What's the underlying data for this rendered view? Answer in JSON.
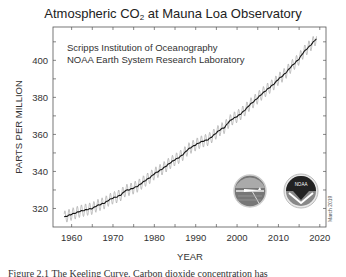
{
  "chart_data": {
    "type": "line",
    "title": "Atmospheric CO2 at Mauna Loa Observatory",
    "title_parts": {
      "pre": "Atmospheric CO",
      "sub": "2",
      "post": " at Mauna Loa Observatory"
    },
    "annotations": [
      "Scripps Institution of Oceanography",
      "NOAA Earth System Research Laboratory",
      "March 2019"
    ],
    "xlabel": "YEAR",
    "ylabel": "PARTS PER MILLION",
    "xlim": [
      1955.5,
      2021.5
    ],
    "ylim": [
      310,
      418
    ],
    "xticks": [
      1960,
      1970,
      1980,
      1990,
      2000,
      2010,
      2020
    ],
    "yticks": [
      320,
      340,
      360,
      380,
      400
    ],
    "grid": false,
    "legend": null,
    "series": [
      {
        "name": "Annual mean CO2 (trend, black line)",
        "x": [
          1958,
          1959,
          1960,
          1961,
          1962,
          1963,
          1964,
          1965,
          1966,
          1967,
          1968,
          1969,
          1970,
          1971,
          1972,
          1973,
          1974,
          1975,
          1976,
          1977,
          1978,
          1979,
          1980,
          1981,
          1982,
          1983,
          1984,
          1985,
          1986,
          1987,
          1988,
          1989,
          1990,
          1991,
          1992,
          1993,
          1994,
          1995,
          1996,
          1997,
          1998,
          1999,
          2000,
          2001,
          2002,
          2003,
          2004,
          2005,
          2006,
          2007,
          2008,
          2009,
          2010,
          2011,
          2012,
          2013,
          2014,
          2015,
          2016,
          2017,
          2018,
          2019
        ],
        "values": [
          315.2,
          316.0,
          316.9,
          317.6,
          318.5,
          319.0,
          319.6,
          320.0,
          321.4,
          322.2,
          323.0,
          324.6,
          325.7,
          326.3,
          327.5,
          329.7,
          330.2,
          331.1,
          332.1,
          333.8,
          335.4,
          336.8,
          338.8,
          340.1,
          341.5,
          343.2,
          344.9,
          346.4,
          347.6,
          349.3,
          351.7,
          353.2,
          354.4,
          355.7,
          356.5,
          357.2,
          358.9,
          360.9,
          362.7,
          363.8,
          366.8,
          368.5,
          369.7,
          371.3,
          373.4,
          375.9,
          377.7,
          379.8,
          381.9,
          383.8,
          385.6,
          387.4,
          389.9,
          391.6,
          393.8,
          396.5,
          398.6,
          400.8,
          404.2,
          406.5,
          408.7,
          411.4
        ]
      },
      {
        "name": "Monthly CO2 (seasonal cycle, gray)",
        "seasonal_amplitude_ppm": 6.5
      }
    ]
  },
  "chart": {
    "title_pre": "Atmospheric CO",
    "title_sub": "2",
    "title_post": " at Mauna Loa Observatory",
    "annotation_line1": "Scripps Institution of Oceanography",
    "annotation_line2": "NOAA Earth System Research Laboratory",
    "date_stamp": "March 2019",
    "xlabel": "YEAR",
    "ylabel": "PARTS PER MILLION",
    "logos": [
      "scripps-logo",
      "noaa-logo"
    ],
    "logo_noaa_text": "NOAA"
  },
  "caption": "Figure 2.1 The Keeling Curve. Carbon dioxide concentration has"
}
